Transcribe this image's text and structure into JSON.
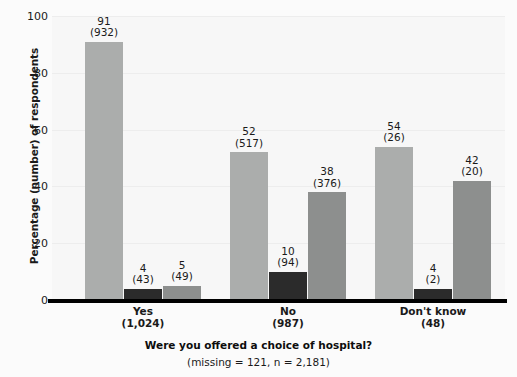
{
  "chart_data": {
    "type": "bar",
    "title": "",
    "xlabel": "Were you offered a choice of hospital?",
    "xsublabel": "(missing = 121, n = 2,181)",
    "ylabel": "Percentage (number) of respondents",
    "ylim": [
      0,
      100
    ],
    "yticks": [
      0,
      20,
      40,
      60,
      80,
      100
    ],
    "ytick_labels": [
      "0",
      "20",
      "40",
      "60",
      "80",
      "100"
    ],
    "grid": true,
    "legend": "none",
    "categories": [
      "Yes",
      "No",
      "Don't know"
    ],
    "category_counts": [
      "(1,024)",
      "(987)",
      "(48)"
    ],
    "series": [
      {
        "name": "series-1",
        "color": "#abadac",
        "values": [
          91,
          52,
          54
        ],
        "counts": [
          932,
          517,
          26
        ],
        "value_labels": [
          "91",
          "52",
          "54"
        ],
        "count_labels": [
          "(932)",
          "(517)",
          "(26)"
        ]
      },
      {
        "name": "series-2",
        "color": "#2b2b2b",
        "values": [
          4,
          10,
          4
        ],
        "counts": [
          43,
          94,
          2
        ],
        "value_labels": [
          "4",
          "10",
          "4"
        ],
        "count_labels": [
          "(43)",
          "(94)",
          "(2)"
        ]
      },
      {
        "name": "series-3",
        "color": "#8d8f8e",
        "values": [
          5,
          38,
          42
        ],
        "counts": [
          49,
          376,
          20
        ],
        "value_labels": [
          "5",
          "38",
          "42"
        ],
        "count_labels": [
          "(49)",
          "(376)",
          "(20)"
        ]
      }
    ]
  },
  "colors": {
    "background": "#fbfbfb",
    "plot_background": "#f7f7f7",
    "gridline": "#ededed",
    "axis": "#000000",
    "text": "#1a1a1a",
    "bar_light": "#abadac",
    "bar_dark": "#2b2b2b",
    "bar_medium": "#8d8f8e"
  }
}
